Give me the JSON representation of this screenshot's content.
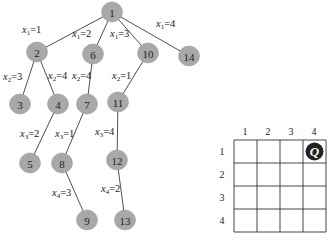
{
  "tree": {
    "nodes": [
      {
        "id": "1",
        "x": 112,
        "y": 12
      },
      {
        "id": "2",
        "x": 37,
        "y": 52
      },
      {
        "id": "6",
        "x": 93,
        "y": 54
      },
      {
        "id": "10",
        "x": 148,
        "y": 53
      },
      {
        "id": "14",
        "x": 189,
        "y": 56
      },
      {
        "id": "3",
        "x": 20,
        "y": 104
      },
      {
        "id": "4",
        "x": 58,
        "y": 104
      },
      {
        "id": "7",
        "x": 87,
        "y": 104
      },
      {
        "id": "11",
        "x": 118,
        "y": 102
      },
      {
        "id": "5",
        "x": 30,
        "y": 163
      },
      {
        "id": "8",
        "x": 62,
        "y": 163
      },
      {
        "id": "12",
        "x": 117,
        "y": 160
      },
      {
        "id": "9",
        "x": 87,
        "y": 220
      },
      {
        "id": "13",
        "x": 125,
        "y": 220
      }
    ],
    "edges": [
      {
        "from": "1",
        "to": "2",
        "var": "x",
        "sub": "1",
        "val": "1",
        "lx": 22,
        "ly": 33
      },
      {
        "from": "1",
        "to": "6",
        "var": "x",
        "sub": "1",
        "val": "2",
        "lx": 72,
        "ly": 37
      },
      {
        "from": "1",
        "to": "10",
        "var": "x",
        "sub": "1",
        "val": "3",
        "lx": 110,
        "ly": 37
      },
      {
        "from": "1",
        "to": "14",
        "var": "x",
        "sub": "1",
        "val": "4",
        "lx": 156,
        "ly": 27
      },
      {
        "from": "2",
        "to": "3",
        "var": "x",
        "sub": "2",
        "val": "3",
        "lx": 3,
        "ly": 80
      },
      {
        "from": "2",
        "to": "4",
        "var": "x",
        "sub": "2",
        "val": "4",
        "lx": 48,
        "ly": 79
      },
      {
        "from": "6",
        "to": "7",
        "var": "x",
        "sub": "2",
        "val": "4",
        "lx": 72,
        "ly": 79
      },
      {
        "from": "10",
        "to": "11",
        "var": "x",
        "sub": "2",
        "val": "1",
        "lx": 112,
        "ly": 79
      },
      {
        "from": "4",
        "to": "5",
        "var": "x",
        "sub": "3",
        "val": "2",
        "lx": 20,
        "ly": 137
      },
      {
        "from": "7",
        "to": "8",
        "var": "x",
        "sub": "3",
        "val": "1",
        "lx": 55,
        "ly": 137
      },
      {
        "from": "11",
        "to": "12",
        "var": "x",
        "sub": "3",
        "val": "4",
        "lx": 95,
        "ly": 135
      },
      {
        "from": "8",
        "to": "9",
        "var": "x",
        "sub": "4",
        "val": "3",
        "lx": 52,
        "ly": 196
      },
      {
        "from": "12",
        "to": "13",
        "var": "x",
        "sub": "4",
        "val": "2",
        "lx": 101,
        "ly": 192
      }
    ]
  },
  "board": {
    "col_labels": [
      "1",
      "2",
      "3",
      "4"
    ],
    "row_labels": [
      "1",
      "2",
      "3",
      "4"
    ],
    "queen": {
      "row": 1,
      "col": 4,
      "glyph": "Q"
    },
    "x0": 234,
    "y0": 140,
    "cell_w": 23,
    "cell_h": 23
  }
}
